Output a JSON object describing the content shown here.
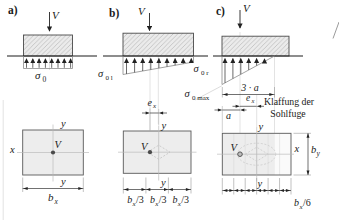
{
  "figure": {
    "panels": {
      "a": {
        "label": "a)",
        "load": "V",
        "sigma": {
          "base": "σ",
          "sub": "0"
        }
      },
      "b": {
        "label": "b)",
        "load": "V",
        "sigma_left": {
          "base": "σ",
          "sub": "0 l"
        },
        "sigma_right": {
          "base": "σ",
          "sub": "0 r"
        }
      },
      "c": {
        "label": "c)",
        "load": "V",
        "sigma_max": {
          "base": "σ",
          "sub": "0 max"
        },
        "contact_width": "3 · a",
        "gap_note_line1": "Klaffung der",
        "gap_note_line2": "Sohlfuge"
      }
    },
    "plans": {
      "left": {
        "axis_x": "x",
        "axis_y_top": "y",
        "axis_y_bottom": "y",
        "load": "V",
        "width": {
          "base": "b",
          "sub": "x"
        }
      },
      "middle": {
        "axis_y_top": "y",
        "axis_y_bottom": "y",
        "load": "V",
        "eccentricity": {
          "base": "e",
          "sub": "x"
        },
        "thirds": [
          {
            "base": "b",
            "sub": "x",
            "den": "/3"
          },
          {
            "base": "b",
            "sub": "x",
            "den": "/3"
          },
          {
            "base": "b",
            "sub": "x",
            "den": "/3"
          }
        ]
      },
      "right": {
        "axis_x": "x",
        "axis_y_top": "y",
        "axis_y_bottom": "y",
        "load": "V",
        "edge_dist": "a",
        "eccentricity": {
          "base": "e",
          "sub": "x"
        },
        "height": {
          "base": "b",
          "sub": "y"
        },
        "sixth": {
          "base": "b",
          "sub": "x",
          "den": "/6"
        }
      }
    },
    "colors": {
      "footing_fill": "#ebebeb",
      "hatch_stroke": "#a8a8a8",
      "plan_fill": "#ededed",
      "gap_zone_fill": "#fafafa",
      "ground_line": "#1c1c1c",
      "stress_outline": "#8c8c8c",
      "dimension": "#222222",
      "construction": "#cccccc"
    }
  }
}
